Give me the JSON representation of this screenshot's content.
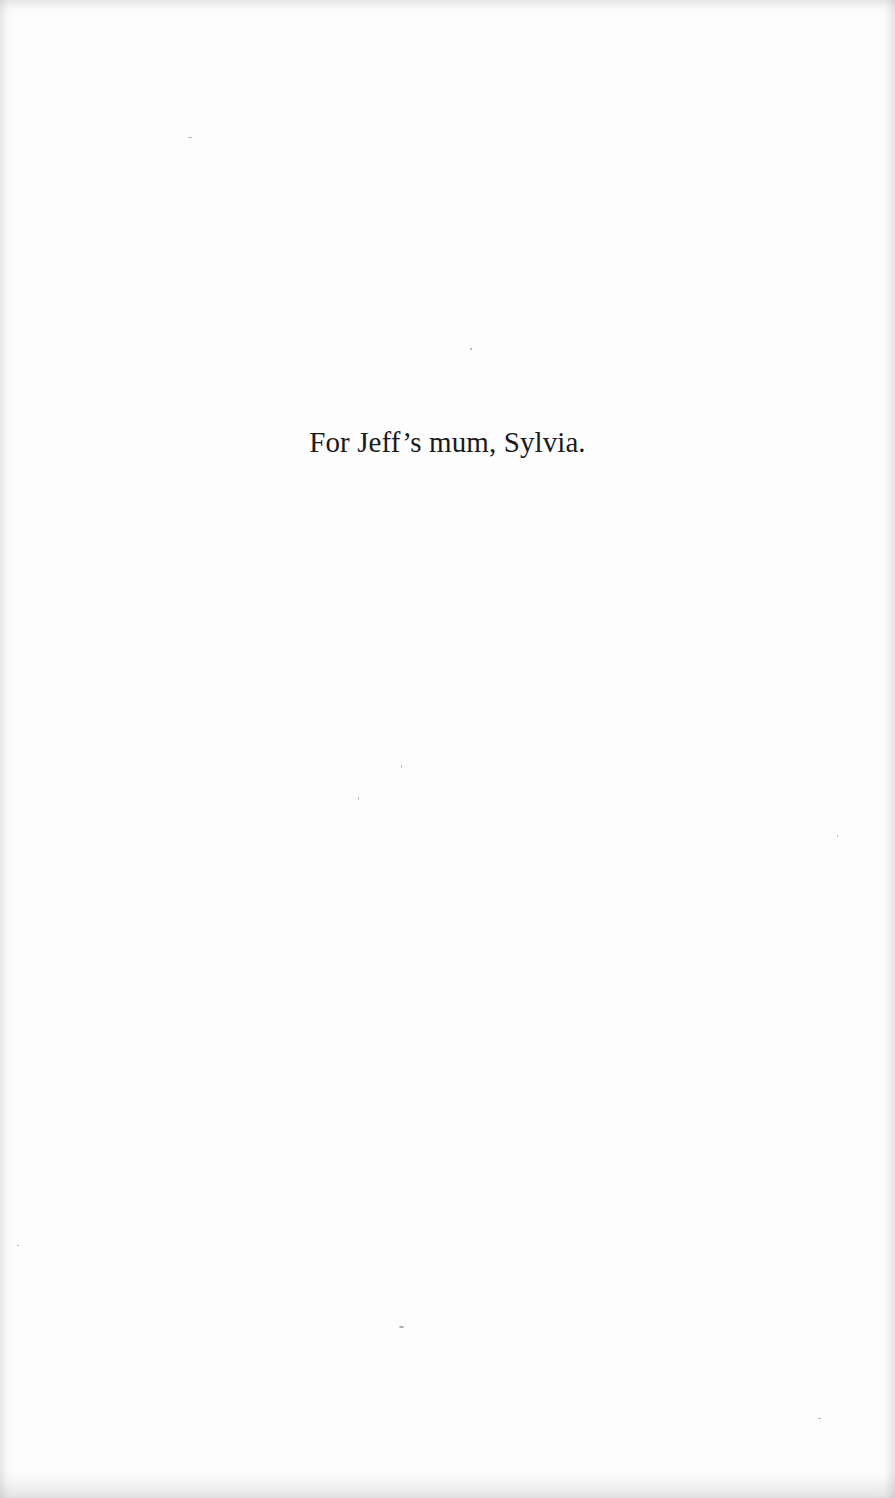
{
  "page": {
    "type": "book-dedication",
    "background_color": "#fdfdfd",
    "text_color": "#1a1a1a"
  },
  "dedication": {
    "text": "For Jeff’s mum, Sylvia."
  }
}
